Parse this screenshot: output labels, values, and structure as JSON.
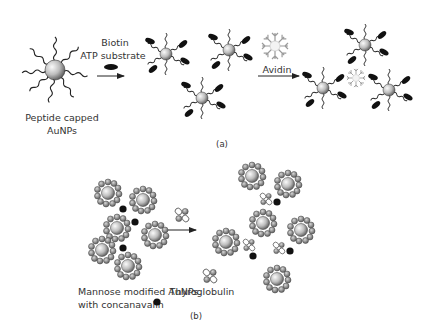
{
  "panel_a": {
    "caption": "(a)",
    "start_label_line1": "Peptide capped",
    "start_label_line2": "AuNPs",
    "step1_label_line1": "Biotin",
    "step1_label_line2": "ATP substrate",
    "step2_label": "Avidin"
  },
  "panel_b": {
    "caption": "(b)",
    "left_label_line1": "Mannose modified AuNPs",
    "left_label_line2": "with concanavalin",
    "protein_label": "Thyroglobulin"
  },
  "colors": {
    "particle_light": "#f2f2f2",
    "particle_dark": "#6a6a6a",
    "ligand": "#222222",
    "biotin": "#111111",
    "avidin": "#9a9a9a",
    "concanavalin": "#111111",
    "text": "#333333"
  }
}
